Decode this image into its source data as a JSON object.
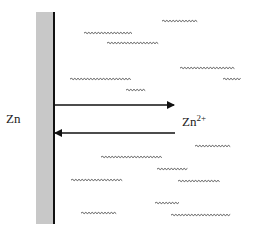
{
  "diagram": {
    "electrode": {
      "label": "Zn",
      "fill_color": "#c8c8c8",
      "edge_color": "#111111",
      "x": 36,
      "y": 12,
      "width": 18,
      "height": 212
    },
    "ion": {
      "label_base": "Zn",
      "label_sup": "2+"
    },
    "arrows": [
      {
        "direction": "right",
        "from_x": 54,
        "to_x": 174,
        "y": 105,
        "meaning": "oxidation: Zn to Zn2+"
      },
      {
        "direction": "left",
        "from_x": 175,
        "to_x": 54,
        "y": 133,
        "meaning": "reduction: Zn2+ to Zn"
      }
    ],
    "solution_wavy_lines": [
      {
        "x1": 162,
        "x2": 198,
        "y": 21
      },
      {
        "x1": 84,
        "x2": 133,
        "y": 33
      },
      {
        "x1": 107,
        "x2": 159,
        "y": 43
      },
      {
        "x1": 180,
        "x2": 235,
        "y": 68
      },
      {
        "x1": 70,
        "x2": 131,
        "y": 79
      },
      {
        "x1": 223,
        "x2": 242,
        "y": 79
      },
      {
        "x1": 126,
        "x2": 146,
        "y": 90
      },
      {
        "x1": 195,
        "x2": 231,
        "y": 146
      },
      {
        "x1": 101,
        "x2": 163,
        "y": 157
      },
      {
        "x1": 157,
        "x2": 188,
        "y": 169
      },
      {
        "x1": 71,
        "x2": 123,
        "y": 180
      },
      {
        "x1": 178,
        "x2": 220,
        "y": 181
      },
      {
        "x1": 155,
        "x2": 179,
        "y": 203
      },
      {
        "x1": 81,
        "x2": 117,
        "y": 213
      },
      {
        "x1": 171,
        "x2": 231,
        "y": 215
      }
    ],
    "colors": {
      "line": "#111111",
      "wavy": "#444444",
      "background": "#ffffff"
    }
  }
}
